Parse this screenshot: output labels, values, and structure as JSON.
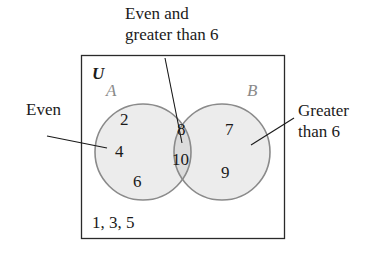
{
  "diagram": {
    "type": "venn",
    "universe": {
      "label": "U",
      "outside_elements": "1, 3, 5"
    },
    "sets": [
      {
        "id": "A",
        "label": "A",
        "description": "Even",
        "only_elements": [
          "2",
          "4",
          "6"
        ]
      },
      {
        "id": "B",
        "label": "B",
        "description": "Greater than 6",
        "only_elements": [
          "7",
          "9"
        ]
      }
    ],
    "intersection": {
      "description": "Even and greater than 6",
      "elements": [
        "8",
        "10"
      ]
    },
    "callouts": {
      "even": "Even",
      "intersection_line1": "Even and",
      "intersection_line2": "greater than 6",
      "greater_line1": "Greater",
      "greater_line2": "than 6"
    },
    "colors": {
      "circle_fill": "#ececec",
      "overlap_fill": "#dcdcdc",
      "circle_stroke": "#8a8a8a",
      "frame_stroke": "#2a2a2a",
      "text": "#1a1a1a",
      "set_label": "#8a8a8a"
    }
  }
}
